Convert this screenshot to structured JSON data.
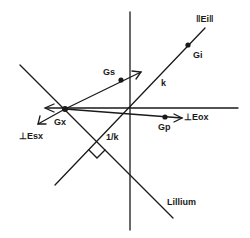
{
  "diagram": {
    "type": "vector-geometry",
    "colors": {
      "line": "#1a1a1a",
      "background": "#ffffff"
    },
    "labels": {
      "e_parallel": "‖Ei‖",
      "gi": "Gi",
      "gs": "Gs",
      "k": "k",
      "gx": "Gx",
      "esx": "⊥Esx",
      "eox": "⊥Eox",
      "gp": "Gp",
      "inv_k": "1/k",
      "lillium": "Lillium"
    },
    "points": [
      {
        "name": "Gi",
        "x": 188,
        "y": 45
      },
      {
        "name": "Gs",
        "x": 121,
        "y": 80
      },
      {
        "name": "Gx",
        "x": 65,
        "y": 109
      },
      {
        "name": "Gp",
        "x": 165,
        "y": 117
      }
    ]
  }
}
